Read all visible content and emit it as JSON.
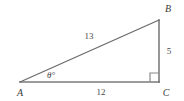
{
  "figure": {
    "type": "geometry-diagram",
    "shape": "right-triangle",
    "background_color": "#ffffff",
    "stroke_color": "#6e6e6e",
    "text_color": "#3a3a3a"
  },
  "vertices": {
    "a_label": "A",
    "b_label": "B",
    "c_label": "C"
  },
  "sides": {
    "hypotenuse_label": "13",
    "base_label": "12",
    "vertical_label": "5"
  },
  "angle": {
    "label": "θ°",
    "at_vertex": "A"
  },
  "markers": {
    "right_angle_at": "C"
  },
  "geometry": {
    "ax": 20,
    "ay": 82,
    "bx": 159,
    "by": 20,
    "cx": 159,
    "cy": 82
  }
}
